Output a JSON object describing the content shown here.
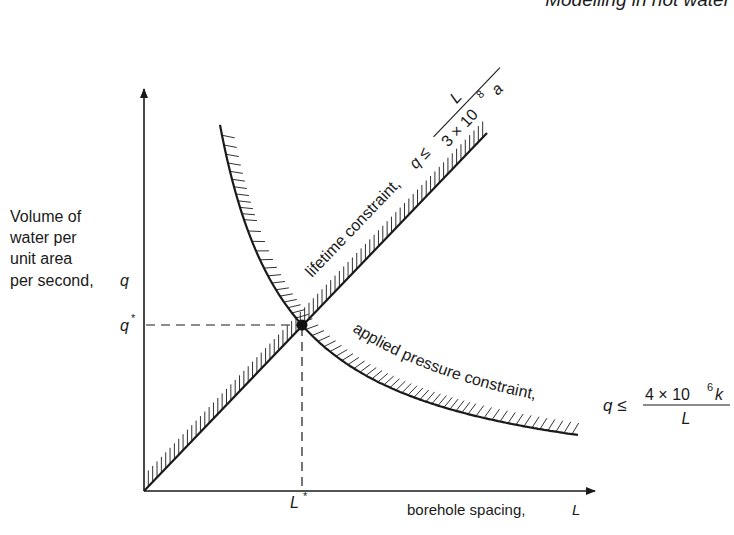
{
  "header": {
    "running_title": "Modelling in hot water"
  },
  "axes": {
    "y_label_lines": [
      "Volume of",
      "water per",
      "unit area",
      "per second,"
    ],
    "y_symbol": "q",
    "y_marker": "q",
    "y_marker_sup": "*",
    "x_label": "borehole spacing,",
    "x_symbol": "L",
    "x_marker": "L",
    "x_marker_sup": "*"
  },
  "constraints": {
    "lifetime": {
      "label": "lifetime constraint,",
      "lhs": "q ≤",
      "numerator": "L",
      "denominator_base": "3 × 10",
      "denominator_exp": "8",
      "denominator_tail": "a"
    },
    "pressure": {
      "label": "applied pressure constraint,",
      "lhs": "q ≤",
      "numerator_base": "4 × 10",
      "numerator_exp": "6",
      "numerator_tail": "k",
      "denominator": "L"
    }
  },
  "optimum": {
    "name": "intersection point (L*, q*)"
  },
  "colors": {
    "ink": "#1a1a1a",
    "background": "#ffffff"
  },
  "chart_data": {
    "type": "line",
    "title": "",
    "xlabel": "borehole spacing, L",
    "ylabel": "Volume of water per unit area per second, q",
    "series": [
      {
        "name": "lifetime constraint, q ≤ L / (3 × 10^8 a)",
        "shape": "straight line through origin, feasible region below-right",
        "relation": "q = L/(3×10^8 a)"
      },
      {
        "name": "applied pressure constraint, q ≤ 4 × 10^6 k / L",
        "shape": "hyperbola, feasible region below-left",
        "relation": "q = 4×10^6 k / L"
      }
    ],
    "annotations": [
      "q*",
      "L*",
      "optimum at intersection (L*, q*)"
    ],
    "grid": false,
    "ticks": "none (qualitative axes)"
  }
}
